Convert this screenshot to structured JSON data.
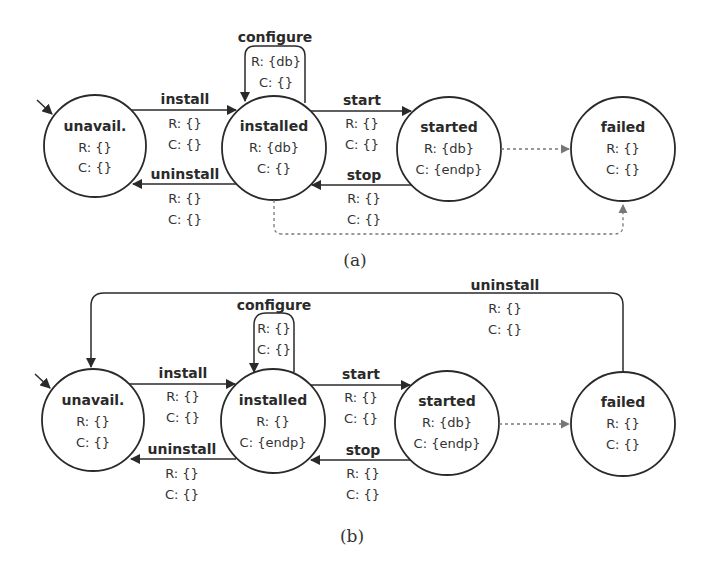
{
  "diagrams": [
    {
      "caption": "(a)",
      "states": [
        {
          "id": "unavail",
          "name": "unavail.",
          "r": "R: {}",
          "c": "C: {}"
        },
        {
          "id": "installed",
          "name": "installed",
          "r": "R: {db}",
          "c": "C: {}"
        },
        {
          "id": "started",
          "name": "started",
          "r": "R: {db}",
          "c": "C: {endp}"
        },
        {
          "id": "failed",
          "name": "failed",
          "r": "R: {}",
          "c": "C: {}"
        }
      ],
      "transitions": {
        "install": {
          "label": "install",
          "r": "R: {}",
          "c": "C: {}"
        },
        "uninstall": {
          "label": "uninstall",
          "r": "R: {}",
          "c": "C: {}"
        },
        "configure": {
          "label": "configure",
          "r": "R: {db}",
          "c": "C: {}"
        },
        "start": {
          "label": "start",
          "r": "R: {}",
          "c": "C: {}"
        },
        "stop": {
          "label": "stop",
          "r": "R: {}",
          "c": "C: {}"
        }
      }
    },
    {
      "caption": "(b)",
      "states": [
        {
          "id": "unavail",
          "name": "unavail.",
          "r": "R: {}",
          "c": "C: {}"
        },
        {
          "id": "installed",
          "name": "installed",
          "r": "R: {}",
          "c": "C: {endp}"
        },
        {
          "id": "started",
          "name": "started",
          "r": "R: {db}",
          "c": "C: {endp}"
        },
        {
          "id": "failed",
          "name": "failed",
          "r": "R: {}",
          "c": "C: {}"
        }
      ],
      "transitions": {
        "install": {
          "label": "install",
          "r": "R: {}",
          "c": "C: {}"
        },
        "uninstall": {
          "label": "uninstall",
          "r": "R: {}",
          "c": "C: {}"
        },
        "configure": {
          "label": "configure",
          "r": "R: {}",
          "c": "C: {}"
        },
        "start": {
          "label": "start",
          "r": "R: {}",
          "c": "C: {}"
        },
        "stop": {
          "label": "stop",
          "r": "R: {}",
          "c": "C: {}"
        },
        "uninstall_failed": {
          "label": "uninstall",
          "r": "R: {}",
          "c": "C: {}"
        }
      }
    }
  ],
  "colors": {
    "line": "#2a2a2a",
    "dashed": "#777777"
  }
}
